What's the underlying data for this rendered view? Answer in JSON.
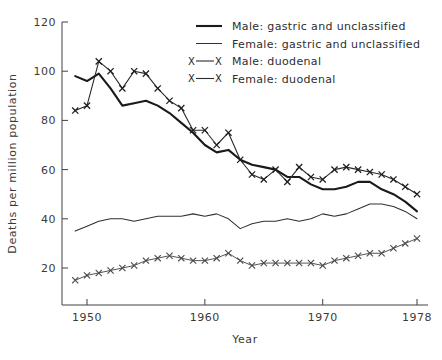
{
  "chart_data": {
    "type": "line",
    "title": "",
    "xlabel": "Year",
    "ylabel": "Deaths per million population",
    "xlim": [
      1948,
      1979
    ],
    "ylim": [
      10,
      120
    ],
    "xticks": [
      1950,
      1960,
      1970,
      1978
    ],
    "xtick_labels": [
      "1950",
      "1960",
      "1970",
      "1978"
    ],
    "yticks": [
      20,
      40,
      60,
      80,
      100,
      120
    ],
    "ytick_labels": [
      "20",
      "40",
      "60",
      "80",
      "100",
      "120"
    ],
    "grid": false,
    "legend_position": "top-right",
    "x": [
      1949,
      1950,
      1951,
      1952,
      1953,
      1954,
      1955,
      1956,
      1957,
      1958,
      1959,
      1960,
      1961,
      1962,
      1963,
      1964,
      1965,
      1966,
      1967,
      1968,
      1969,
      1970,
      1971,
      1972,
      1973,
      1974,
      1975,
      1976,
      1977,
      1978
    ],
    "series": [
      {
        "name": "Male: gastric and unclassified",
        "style": "thick-solid",
        "marker": "none",
        "color": "#1a1a1a",
        "values": [
          98,
          96,
          99,
          93,
          86,
          87,
          88,
          86,
          83,
          79,
          75,
          70,
          67,
          68,
          64,
          62,
          61,
          60,
          57,
          57,
          54,
          52,
          52,
          53,
          55,
          55,
          52,
          50,
          47,
          43
        ]
      },
      {
        "name": "Female: gastric and unclassified",
        "style": "thin-solid",
        "marker": "none",
        "color": "#303030",
        "values": [
          35,
          37,
          39,
          40,
          40,
          39,
          40,
          41,
          41,
          41,
          42,
          41,
          42,
          40,
          36,
          38,
          39,
          39,
          40,
          39,
          40,
          42,
          41,
          42,
          44,
          46,
          46,
          45,
          43,
          40
        ]
      },
      {
        "name": "Male: duodenal",
        "style": "marked",
        "marker": "x",
        "color": "#2a2a2a",
        "values": [
          84,
          86,
          104,
          100,
          93,
          100,
          99,
          93,
          88,
          85,
          76,
          76,
          70,
          75,
          64,
          58,
          56,
          60,
          55,
          61,
          57,
          56,
          60,
          61,
          60,
          59,
          58,
          56,
          53,
          50
        ]
      },
      {
        "name": "Female: duodenal",
        "style": "marked",
        "marker": "x",
        "color": "#555555",
        "values": [
          15,
          17,
          18,
          19,
          20,
          21,
          23,
          24,
          25,
          24,
          23,
          23,
          24,
          26,
          23,
          21,
          22,
          22,
          22,
          22,
          22,
          21,
          23,
          24,
          25,
          26,
          26,
          28,
          30,
          32
        ]
      }
    ],
    "legend_entries": [
      {
        "label": "Male: gastric and unclassified",
        "style": "thick-solid",
        "marker": "none"
      },
      {
        "label": "Female: gastric and unclassified",
        "style": "thin-solid",
        "marker": "none"
      },
      {
        "label": "Male: duodenal",
        "style": "marked",
        "marker": "x"
      },
      {
        "label": "Female: duodenal",
        "style": "marked",
        "marker": "x"
      }
    ]
  },
  "page": {
    "top_strip_text": "",
    "top_strip_number": ""
  }
}
